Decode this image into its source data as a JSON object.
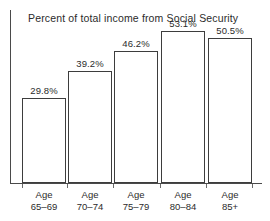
{
  "chart_data": {
    "type": "bar",
    "title": "Percent of total income from Social Security",
    "xlabel": "",
    "ylabel": "",
    "ylim": [
      0,
      60
    ],
    "grid": false,
    "legend": false,
    "categories": [
      "Age 65–69",
      "Age 70–74",
      "Age 75–79",
      "Age 80–84",
      "Age 85+"
    ],
    "category_lines": [
      {
        "line1": "Age",
        "line2": "65–69"
      },
      {
        "line1": "Age",
        "line2": "70–74"
      },
      {
        "line1": "Age",
        "line2": "75–79"
      },
      {
        "line1": "Age",
        "line2": "80–84"
      },
      {
        "line1": "Age",
        "line2": "85+"
      }
    ],
    "values": [
      29.8,
      39.2,
      46.2,
      53.1,
      50.5
    ],
    "data_labels": [
      "29.8%",
      "39.2%",
      "46.2%",
      "53.1%",
      "50.5%"
    ],
    "bar_fill": "#ffffff",
    "bar_outline": "#3d3d3d",
    "axis_color": "#4a4a4a",
    "text_color": "#2b2b2b",
    "background": "#ffffff"
  }
}
